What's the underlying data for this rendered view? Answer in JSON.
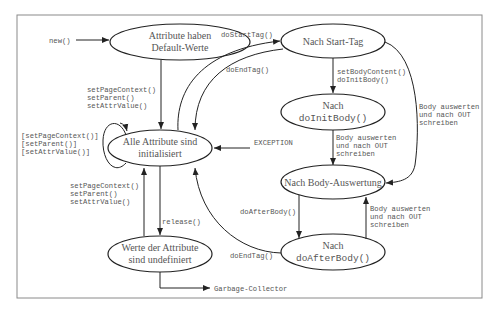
{
  "diagram": {
    "type": "state-diagram",
    "nodes": {
      "default": {
        "line1": "Attribute haben",
        "line2": "Default-Werte"
      },
      "initialized": {
        "line1": "Alle Attribute sind",
        "line2": "initialisiert"
      },
      "undefined": {
        "line1": "Werte der Attribute",
        "line2": "sind undefiniert"
      },
      "start_tag": {
        "line1": "Nach Start-Tag"
      },
      "init_body": {
        "line1": "Nach",
        "line2": "doInitBody()"
      },
      "body_eval": {
        "line1": "Nach Body-Auswertung"
      },
      "after_body": {
        "line1": "Nach",
        "line2": "doAfterBody()"
      }
    },
    "edges": {
      "new": "new()",
      "set_attrs_1": [
        "setPageContext()",
        "setParent()",
        "setAttrValue()"
      ],
      "self_loop": [
        "[setPageContext()]",
        "[setParent()]",
        "[setAttrValue()]"
      ],
      "set_attrs_2": [
        "setPageContext()",
        "setParent()",
        "setAttrValue()"
      ],
      "release": "release()",
      "exception": "EXCEPTION",
      "garbage": "Garbage-Collector",
      "do_start_tag": "doStartTag()",
      "do_end_tag_1": "doEndTag()",
      "set_body_content": [
        "setBodyContent()",
        "doInitBody()"
      ],
      "body_eval_1": [
        "Body auswerten",
        "und nach OUT",
        "schreiben"
      ],
      "body_eval_2": [
        "Body auswerten",
        "und nach OUT",
        "schreiben"
      ],
      "do_after_body": "doAfterBody()",
      "body_eval_3": [
        "Body auswerten",
        "und nach OUT",
        "schreiben"
      ],
      "do_end_tag_2": "doEndTag()"
    }
  }
}
